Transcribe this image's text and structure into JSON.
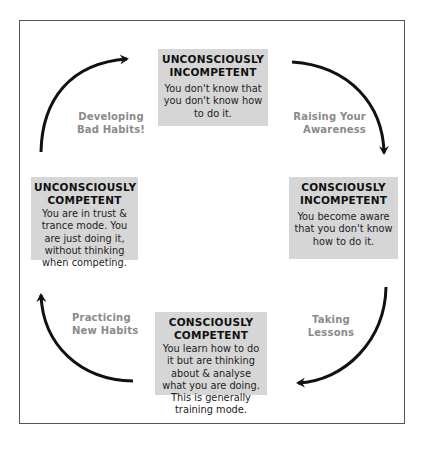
{
  "diagram": {
    "type": "cycle",
    "stages": [
      {
        "id": "unconsciously-incompetent",
        "title": "UNCONSCIOUSLY INCOMPETENT",
        "title_line1": "UNCONSCIOUSLY",
        "title_line2": "INCOMPETENT",
        "description": "You don't know that you don't know how to do it.",
        "position": "top"
      },
      {
        "id": "consciously-incompetent",
        "title": "CONSCIOUSLY INCOMPETENT",
        "title_line1": "CONSCIOUSLY",
        "title_line2": "INCOMPETENT",
        "description": "You become aware that you don't know how to do it.",
        "position": "right"
      },
      {
        "id": "consciously-competent",
        "title": "CONSCIOUSLY COMPETENT",
        "title_line1": "CONSCIOUSLY",
        "title_line2": "COMPETENT",
        "description": "You learn how to do it but are thinking about & analyse what you are doing. This is generally training mode.",
        "position": "bottom"
      },
      {
        "id": "unconsciously-competent",
        "title": "UNCONSCIOUSLY COMPETENT",
        "title_line1": "UNCONSCIOUSLY",
        "title_line2": "COMPETENT",
        "description": "You are in trust & trance mode. You are just doing it, without thinking when competing.",
        "position": "left"
      }
    ],
    "transitions": [
      {
        "from": "unconsciously-incompetent",
        "to": "consciously-incompetent",
        "label": "Raising Your Awareness",
        "line1": "Raising Your",
        "line2": "Awareness"
      },
      {
        "from": "consciously-incompetent",
        "to": "consciously-competent",
        "label": "Taking Lessons",
        "line1": "Taking",
        "line2": "Lessons"
      },
      {
        "from": "consciously-competent",
        "to": "unconsciously-competent",
        "label": "Practicing New Habits",
        "line1": "Practicing",
        "line2": "New Habits"
      },
      {
        "from": "unconsciously-competent",
        "to": "unconsciously-incompetent",
        "label": "Developing Bad Habits!",
        "line1": "Developing",
        "line2": "Bad Habits!"
      }
    ],
    "colors": {
      "box_fill": "#d6d6d6",
      "label_text": "#8a8a8a",
      "arrow": "#111111",
      "frame": "#555555"
    }
  }
}
